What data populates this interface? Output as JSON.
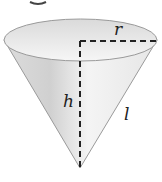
{
  "figure": {
    "type": "right circular cone (inverted)",
    "labels": {
      "radius": "r",
      "height": "h",
      "slant_height": "l"
    },
    "top_fragment": "g"
  },
  "colors": {
    "cone_fill_light": "#f2f2f2",
    "cone_fill_shade": "#d6d6d6",
    "outline": "#8a8a8a",
    "dashes": "#222222"
  }
}
